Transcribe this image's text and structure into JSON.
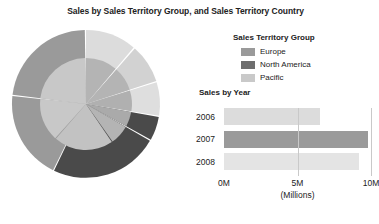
{
  "report": {
    "title": "Sales by Sales Territory Group, and Sales Territory Country"
  },
  "legend": {
    "title": "Sales Territory Group",
    "items": [
      {
        "label": "Europe",
        "color": "#9a9a9a"
      },
      {
        "label": "North America",
        "color": "#6e6e6e"
      },
      {
        "label": "Pacific",
        "color": "#c9c9c9"
      }
    ]
  },
  "bar_section": {
    "title": "Sales by Year"
  },
  "chart_data": [
    {
      "type": "pie",
      "title": "Sales by Sales Territory Group, and Sales Territory Country",
      "subtitle": "",
      "legend_position": "right",
      "rings": [
        {
          "name": "Sales Territory Group",
          "level": "inner",
          "slices": [
            {
              "label": "Pacific",
              "value": 22,
              "color": "#c9c9c9"
            },
            {
              "label": "North America",
              "value": 48,
              "color": "#9a9a9a"
            },
            {
              "label": "Europe",
              "value": 30,
              "color": "#b0b0b0"
            }
          ]
        },
        {
          "name": "Sales Territory Country",
          "level": "outer",
          "slices": [
            {
              "label": "Pacific",
              "value": 22,
              "color": "#d8d8d8"
            },
            {
              "label": "North America",
              "value": 26,
              "color": "#4a4a4a"
            },
            {
              "label": "Europe",
              "value": 52,
              "color": "#9a9a9a"
            }
          ]
        }
      ]
    },
    {
      "type": "bar",
      "orientation": "horizontal",
      "title": "Sales by Year",
      "categories": [
        "2006",
        "2007",
        "2008"
      ],
      "values": [
        6.5,
        9.8,
        9.2
      ],
      "colors": [
        "#dcdcdc",
        "#9a9a9a",
        "#e4e4e4"
      ],
      "xlabel": "(Millions)",
      "ylabel": "",
      "xlim": [
        0,
        10
      ],
      "xticks": [
        0,
        5,
        10
      ],
      "xticklabels": [
        "0M",
        "5M",
        "10M"
      ],
      "grid": true
    }
  ]
}
